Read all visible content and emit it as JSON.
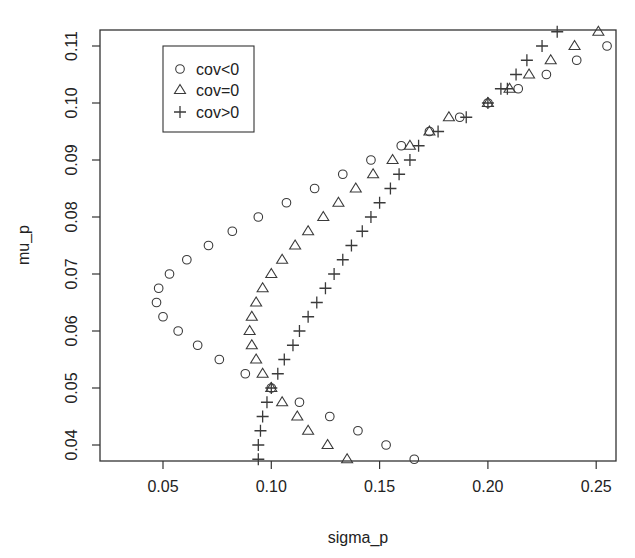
{
  "chart_data": {
    "type": "scatter",
    "title": "",
    "xlabel": "sigma_p",
    "ylabel": "mu_p",
    "xlim": [
      0.021,
      0.259
    ],
    "ylim": [
      0.0365,
      0.1128
    ],
    "xticks": [
      0.05,
      0.1,
      0.15,
      0.2,
      0.25
    ],
    "xtick_labels": [
      "0.05",
      "0.10",
      "0.15",
      "0.20",
      "0.25"
    ],
    "yticks": [
      0.04,
      0.05,
      0.06,
      0.07,
      0.08,
      0.09,
      0.1,
      0.11
    ],
    "ytick_labels": [
      "0.04",
      "0.05",
      "0.06",
      "0.07",
      "0.08",
      "0.09",
      "0.10",
      "0.11"
    ],
    "grid": false,
    "legend_position": "top-left",
    "legend": [
      {
        "label": "cov<0",
        "marker": "circle"
      },
      {
        "label": "cov=0",
        "marker": "triangle"
      },
      {
        "label": "cov>0",
        "marker": "plus"
      }
    ],
    "series": [
      {
        "name": "cov<0",
        "marker": "circle",
        "points": [
          [
            0.166,
            0.0375
          ],
          [
            0.153,
            0.04
          ],
          [
            0.14,
            0.0425
          ],
          [
            0.127,
            0.045
          ],
          [
            0.113,
            0.0475
          ],
          [
            0.1,
            0.05
          ],
          [
            0.088,
            0.0525
          ],
          [
            0.076,
            0.055
          ],
          [
            0.066,
            0.0575
          ],
          [
            0.057,
            0.06
          ],
          [
            0.05,
            0.0625
          ],
          [
            0.047,
            0.065
          ],
          [
            0.048,
            0.0675
          ],
          [
            0.053,
            0.07
          ],
          [
            0.061,
            0.0725
          ],
          [
            0.071,
            0.075
          ],
          [
            0.082,
            0.0775
          ],
          [
            0.094,
            0.08
          ],
          [
            0.107,
            0.0825
          ],
          [
            0.12,
            0.085
          ],
          [
            0.133,
            0.0875
          ],
          [
            0.146,
            0.09
          ],
          [
            0.16,
            0.0925
          ],
          [
            0.173,
            0.095
          ],
          [
            0.187,
            0.0975
          ],
          [
            0.2,
            0.1
          ],
          [
            0.214,
            0.1025
          ],
          [
            0.227,
            0.105
          ],
          [
            0.241,
            0.1075
          ],
          [
            0.255,
            0.11
          ]
        ]
      },
      {
        "name": "cov=0",
        "marker": "triangle",
        "points": [
          [
            0.135,
            0.0375
          ],
          [
            0.126,
            0.04
          ],
          [
            0.117,
            0.0425
          ],
          [
            0.112,
            0.045
          ],
          [
            0.105,
            0.0475
          ],
          [
            0.1,
            0.05
          ],
          [
            0.096,
            0.0525
          ],
          [
            0.093,
            0.055
          ],
          [
            0.091,
            0.0575
          ],
          [
            0.09,
            0.06
          ],
          [
            0.091,
            0.0625
          ],
          [
            0.093,
            0.065
          ],
          [
            0.096,
            0.0675
          ],
          [
            0.1,
            0.07
          ],
          [
            0.105,
            0.0725
          ],
          [
            0.111,
            0.075
          ],
          [
            0.117,
            0.0775
          ],
          [
            0.124,
            0.08
          ],
          [
            0.131,
            0.0825
          ],
          [
            0.139,
            0.085
          ],
          [
            0.147,
            0.0875
          ],
          [
            0.156,
            0.09
          ],
          [
            0.164,
            0.0925
          ],
          [
            0.173,
            0.095
          ],
          [
            0.182,
            0.0975
          ],
          [
            0.2,
            0.1
          ],
          [
            0.21,
            0.1025
          ],
          [
            0.219,
            0.105
          ],
          [
            0.229,
            0.1075
          ],
          [
            0.24,
            0.11
          ],
          [
            0.251,
            0.1125
          ]
        ]
      },
      {
        "name": "cov>0",
        "marker": "plus",
        "points": [
          [
            0.094,
            0.0375
          ],
          [
            0.094,
            0.04
          ],
          [
            0.095,
            0.0425
          ],
          [
            0.096,
            0.045
          ],
          [
            0.098,
            0.0475
          ],
          [
            0.1,
            0.05
          ],
          [
            0.103,
            0.0525
          ],
          [
            0.106,
            0.055
          ],
          [
            0.11,
            0.0575
          ],
          [
            0.113,
            0.06
          ],
          [
            0.117,
            0.0625
          ],
          [
            0.121,
            0.065
          ],
          [
            0.125,
            0.0675
          ],
          [
            0.129,
            0.07
          ],
          [
            0.133,
            0.0725
          ],
          [
            0.137,
            0.075
          ],
          [
            0.142,
            0.0775
          ],
          [
            0.146,
            0.08
          ],
          [
            0.15,
            0.0825
          ],
          [
            0.155,
            0.085
          ],
          [
            0.159,
            0.0875
          ],
          [
            0.164,
            0.09
          ],
          [
            0.168,
            0.0925
          ],
          [
            0.177,
            0.095
          ],
          [
            0.19,
            0.0975
          ],
          [
            0.2,
            0.1
          ],
          [
            0.206,
            0.1025
          ],
          [
            0.209,
            0.1025
          ],
          [
            0.213,
            0.105
          ],
          [
            0.218,
            0.1075
          ],
          [
            0.225,
            0.11
          ],
          [
            0.232,
            0.1125
          ]
        ]
      }
    ]
  },
  "layout": {
    "plot_box": {
      "left": 100,
      "top": 30,
      "right": 616,
      "bottom": 461
    },
    "legend_box": {
      "left": 163,
      "top": 46,
      "width": 91,
      "height": 86
    },
    "colors": {
      "axis": "#333333",
      "marker": "#3a3a3a",
      "background": "#ffffff"
    }
  }
}
